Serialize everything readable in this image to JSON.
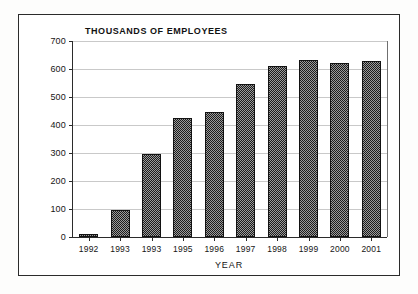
{
  "chart_data": {
    "type": "bar",
    "title": "THOUSANDS OF EMPLOYEES",
    "xlabel": "YEAR",
    "ylabel": "",
    "categories": [
      "1992",
      "1993",
      "1993",
      "1995",
      "1996",
      "1997",
      "1998",
      "1999",
      "2000",
      "2001"
    ],
    "values": [
      10,
      96,
      295,
      425,
      445,
      545,
      612,
      632,
      622,
      630
    ],
    "ylim": [
      0,
      700
    ],
    "ytick_labels": [
      "700",
      "600",
      "500",
      "400",
      "300",
      "200",
      "100",
      "0"
    ],
    "ytick_values": [
      700,
      600,
      500,
      400,
      300,
      200,
      100,
      0
    ],
    "ystep": 100,
    "grid": true,
    "legend": "none",
    "series": [
      {
        "name": "Employees (thousands)",
        "values": [
          10,
          96,
          295,
          425,
          445,
          545,
          612,
          632,
          622,
          630
        ]
      }
    ],
    "colors": {
      "bar_fill": "#4a4a4a",
      "bar_outline": "#121212",
      "axis": "#2b2b2b",
      "gridline": "#c9c9c9",
      "text": "#151515",
      "background": "#ffffff"
    }
  }
}
